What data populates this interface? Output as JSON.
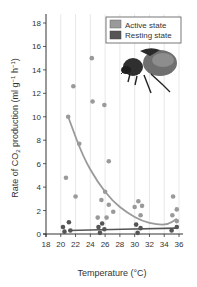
{
  "chart_data": {
    "type": "scatter",
    "title": "",
    "xlabel": "Temperature (°C)",
    "ylabel": "Rate of CO2 production (ml g-1 h-1)",
    "ylabel_parts": {
      "prefix": "Rate of CO",
      "sub": "2",
      "mid": " production (ml g",
      "sup1": "−1",
      "mid2": " h",
      "sup2": "−1",
      "suffix": ")"
    },
    "xlim": [
      18,
      36
    ],
    "ylim": [
      0,
      18
    ],
    "xticks": [
      18,
      20,
      22,
      24,
      26,
      28,
      30,
      32,
      34,
      36
    ],
    "yticks": [
      0,
      2,
      4,
      6,
      8,
      10,
      12,
      14,
      16,
      18
    ],
    "grid": {
      "vertical": true,
      "horizontal": false
    },
    "legend": {
      "position": "top-right",
      "entries": [
        "Active state",
        "Resting state"
      ]
    },
    "annotation": "beetle illustration (upper right)",
    "series": [
      {
        "name": "Active state",
        "color": "#9a9a9a",
        "points": [
          [
            20.7,
            4.8
          ],
          [
            21.0,
            10.0
          ],
          [
            21.7,
            12.6
          ],
          [
            22.0,
            3.2
          ],
          [
            22.5,
            7.7
          ],
          [
            24.2,
            15.0
          ],
          [
            24.3,
            11.3
          ],
          [
            25.0,
            1.4
          ],
          [
            25.5,
            2.9
          ],
          [
            25.9,
            11.0
          ],
          [
            26.0,
            3.6
          ],
          [
            26.2,
            1.4
          ],
          [
            26.5,
            6.2
          ],
          [
            26.5,
            2.5
          ],
          [
            27.1,
            1.9
          ],
          [
            30.0,
            2.3
          ],
          [
            30.5,
            2.8
          ],
          [
            30.8,
            1.6
          ],
          [
            31.0,
            2.4
          ],
          [
            35.2,
            3.2
          ],
          [
            35.1,
            1.6
          ],
          [
            35.7,
            2.1
          ],
          [
            35.7,
            1.1
          ]
        ],
        "trend": [
          [
            21.0,
            10.0
          ],
          [
            23.0,
            6.6
          ],
          [
            25.0,
            4.4
          ],
          [
            27.0,
            2.8
          ],
          [
            29.0,
            1.8
          ],
          [
            31.0,
            1.1
          ],
          [
            33.0,
            0.8
          ],
          [
            34.5,
            0.8
          ],
          [
            35.7,
            1.3
          ]
        ]
      },
      {
        "name": "Resting state",
        "color": "#555555",
        "points": [
          [
            20.3,
            0.6
          ],
          [
            20.5,
            0.2
          ],
          [
            21.1,
            1.0
          ],
          [
            21.3,
            0.3
          ],
          [
            25.1,
            0.6
          ],
          [
            25.3,
            0.1
          ],
          [
            25.6,
            0.9
          ],
          [
            25.9,
            0.4
          ],
          [
            30.2,
            0.8
          ],
          [
            30.4,
            0.1
          ],
          [
            30.8,
            0.5
          ],
          [
            35.0,
            0.3
          ],
          [
            35.7,
            0.6
          ]
        ],
        "trend": [
          [
            21.0,
            0.3
          ],
          [
            35.7,
            0.5
          ]
        ]
      }
    ]
  }
}
